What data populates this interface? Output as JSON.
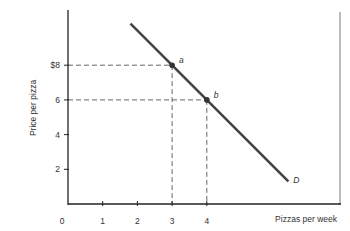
{
  "chart_data": {
    "type": "line",
    "title": "",
    "xlabel": "Pizzas per week",
    "ylabel": "Price per pizza",
    "origin_label": "0",
    "x_ticks": [
      1,
      2,
      3,
      4
    ],
    "x_tick_labels": [
      "1",
      "2",
      "3",
      "4"
    ],
    "y_ticks": [
      2,
      4,
      6,
      8
    ],
    "y_tick_labels": [
      "2",
      "4",
      "6",
      "$8"
    ],
    "xlim": [
      0,
      7.9
    ],
    "ylim": [
      0,
      11.1
    ],
    "grid": false,
    "series": [
      {
        "name": "D",
        "label": "D",
        "x": [
          1.8,
          6.35
        ],
        "y": [
          10.4,
          1.3
        ],
        "equation": "P = 14 - 2Q",
        "color": "#444444"
      }
    ],
    "points": [
      {
        "label": "a",
        "x": 3,
        "y": 8
      },
      {
        "label": "b",
        "x": 4,
        "y": 6
      }
    ],
    "guides": [
      {
        "from_point": "a",
        "style": "dashed"
      },
      {
        "from_point": "b",
        "style": "dashed"
      }
    ]
  },
  "colors": {
    "axis": "#222222",
    "curve": "#444444",
    "frame": "#bbbbbb",
    "guide": "#555555"
  }
}
